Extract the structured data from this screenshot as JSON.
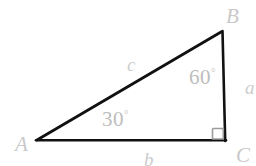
{
  "figure": {
    "background_color": "#ffffff",
    "stroke_color": "#111111",
    "label_color": "#c9c9c9",
    "right_angle_color": "#9a9a9a",
    "stroke_width": 2.6,
    "vertices": {
      "A": {
        "label": "A",
        "x": 37,
        "y": 140
      },
      "B": {
        "label": "B",
        "x": 221,
        "y": 32
      },
      "C": {
        "label": "C",
        "x": 225,
        "y": 140
      }
    },
    "sides": {
      "a": {
        "label": "a",
        "from": "B",
        "to": "C"
      },
      "b": {
        "label": "b",
        "from": "A",
        "to": "C"
      },
      "c": {
        "label": "c",
        "from": "A",
        "to": "B"
      }
    },
    "angles": {
      "A": {
        "label": "30",
        "degree_symbol": "°",
        "value": 30,
        "at": "A"
      },
      "B": {
        "label": "60",
        "degree_symbol": "°",
        "value": 60,
        "at": "B"
      },
      "C": {
        "label": "right-angle",
        "value": 90,
        "at": "C",
        "marker": "square"
      }
    },
    "right_angle_marker": {
      "x": 212,
      "y": 127,
      "size": 13
    }
  }
}
